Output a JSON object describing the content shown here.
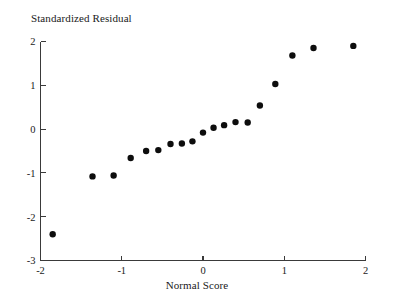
{
  "chart_data": {
    "type": "scatter",
    "title": "Standardized Residual",
    "subtitle": "",
    "xlabel": "Normal Score",
    "ylabel": "Standardized Residual",
    "ylabel_position": "top-left-above-axis",
    "xlim": [
      -2.0,
      2.0
    ],
    "ylim": [
      -3.0,
      2.0
    ],
    "xticks": [
      -2,
      -1,
      0,
      1,
      2
    ],
    "xtick_labels": [
      "-2",
      "-1",
      "0",
      "1",
      "2"
    ],
    "yticks": [
      2,
      1,
      0,
      -1,
      -2,
      -3
    ],
    "ytick_labels": [
      "2",
      "1",
      "0",
      "-1",
      "-2",
      "-3"
    ],
    "grid": false,
    "legend": null,
    "marker": "filled-circle",
    "marker_color": "#0d0d0d",
    "marker_size_px": 4.2,
    "n_points": 20,
    "x": [
      -1.85,
      -1.36,
      -1.1,
      -0.89,
      -0.7,
      -0.55,
      -0.4,
      -0.26,
      -0.13,
      0.0,
      0.13,
      0.26,
      0.4,
      0.55,
      0.7,
      0.89,
      1.1,
      1.36,
      1.85
    ],
    "y": [
      -2.4,
      -1.08,
      -1.06,
      -0.66,
      -0.5,
      -0.48,
      -0.34,
      -0.33,
      -0.28,
      -0.08,
      0.03,
      0.09,
      0.16,
      0.15,
      0.54,
      1.03,
      1.68,
      1.85,
      1.9
    ],
    "points": [
      {
        "x": -1.85,
        "y": -2.4
      },
      {
        "x": -1.36,
        "y": -1.08
      },
      {
        "x": -1.1,
        "y": -1.06
      },
      {
        "x": -0.89,
        "y": -0.66
      },
      {
        "x": -0.7,
        "y": -0.5
      },
      {
        "x": -0.55,
        "y": -0.48
      },
      {
        "x": -0.4,
        "y": -0.34
      },
      {
        "x": -0.26,
        "y": -0.33
      },
      {
        "x": -0.13,
        "y": -0.28
      },
      {
        "x": 0.0,
        "y": -0.08
      },
      {
        "x": 0.13,
        "y": 0.03
      },
      {
        "x": 0.26,
        "y": 0.09
      },
      {
        "x": 0.4,
        "y": 0.16
      },
      {
        "x": 0.55,
        "y": 0.15
      },
      {
        "x": 0.7,
        "y": 0.54
      },
      {
        "x": 0.89,
        "y": 1.03
      },
      {
        "x": 1.1,
        "y": 1.68
      },
      {
        "x": 1.36,
        "y": 1.85
      },
      {
        "x": 1.85,
        "y": 1.9
      }
    ]
  },
  "colors": {
    "background": "#ffffff",
    "axis": "#3a3a3a",
    "text": "#1a1a1a",
    "marker": "#0d0d0d"
  }
}
